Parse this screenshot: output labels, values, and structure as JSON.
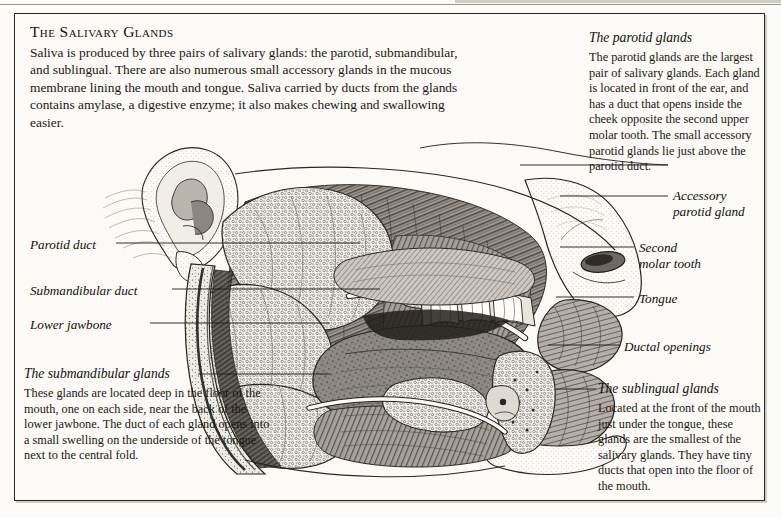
{
  "page": {
    "background_color": "#fbfaf6",
    "border_color": "#2a2622",
    "text_color": "#1a1714"
  },
  "title": "The Salivary Glands",
  "intro": "Saliva is produced by three pairs of salivary glands: the parotid, submandibular, and sublingual. There are also numerous small accessory glands in the mucous membrane lining the mouth and tongue. Saliva carried by ducts from the glands contains amylase, a digestive enzyme; it also makes chewing and swallowing easier.",
  "blocks": {
    "parotid": {
      "heading": "The parotid glands",
      "body": "The parotid glands are the largest pair of salivary glands. Each gland is located in front of the ear, and has a duct that opens inside the cheek opposite the second upper molar tooth. The small accessory parotid glands lie just above the parotid duct."
    },
    "submandibular": {
      "heading": "The submandibular glands",
      "body": "These glands are located deep in the floor of the mouth, one on each side, near the back of the lower jawbone. The duct of each gland opens into a small swelling on the underside of the tongue next to the central fold."
    },
    "sublingual": {
      "heading": "The sublingual glands",
      "body": "Located at the front of the mouth just under the tongue, these glands are the smallest of the salivary glands. They have tiny ducts that open into the floor of the mouth."
    }
  },
  "callouts": {
    "parotid_duct": "Parotid duct",
    "submandibular_duct": "Submandibular duct",
    "lower_jawbone": "Lower jawbone",
    "accessory_parotid_gland_line1": "Accessory",
    "accessory_parotid_gland_line2": "parotid gland",
    "second_molar_line1": "Second",
    "second_molar_line2": "molar tooth",
    "tongue": "Tongue",
    "ductal_openings": "Ductal openings"
  },
  "illustration": {
    "kind": "anatomical-engraving",
    "subject": "sagittal-view-of-head-showing-salivary-glands",
    "style": "black-and-white-line-engraving",
    "parts": [
      "ear",
      "parotid-gland",
      "parotid-duct",
      "accessory-parotid-gland",
      "masseter-muscle",
      "lower-jawbone",
      "submandibular-gland",
      "submandibular-duct",
      "sublingual-gland",
      "tongue",
      "upper-teeth",
      "lower-teeth",
      "second-molar-tooth",
      "nose",
      "upper-lip",
      "lower-lip",
      "ductal-openings"
    ]
  }
}
